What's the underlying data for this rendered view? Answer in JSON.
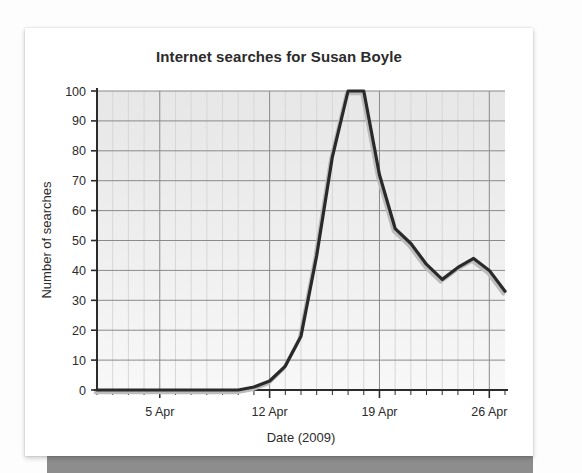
{
  "chart_data": {
    "type": "line",
    "title": "Internet searches for Susan Boyle",
    "xlabel": "Date (2009)",
    "ylabel": "Number of searches",
    "xlim": [
      1,
      27
    ],
    "ylim": [
      0,
      100
    ],
    "grid": true,
    "legend": "none",
    "y_ticks": [
      0,
      10,
      20,
      30,
      40,
      50,
      60,
      70,
      80,
      90,
      100
    ],
    "y_tick_labels": [
      "0",
      "10",
      "20",
      "30",
      "40",
      "50",
      "60",
      "70",
      "80",
      "90",
      "100"
    ],
    "x_ticks": [
      5,
      12,
      19,
      26
    ],
    "x_tick_labels": [
      "5 Apr",
      "12 Apr",
      "19 Apr",
      "26 Apr"
    ],
    "x_minor_step": 1,
    "series": [
      {
        "name": "Number of searches",
        "color": "#2a2a2a",
        "x": [
          1,
          2,
          3,
          4,
          5,
          6,
          7,
          8,
          9,
          10,
          11,
          12,
          13,
          14,
          15,
          16,
          17,
          18,
          19,
          20,
          21,
          22,
          23,
          24,
          25,
          26,
          27
        ],
        "values": [
          0,
          0,
          0,
          0,
          0,
          0,
          0,
          0,
          0,
          0,
          1,
          3,
          8,
          18,
          45,
          78,
          100,
          100,
          72,
          54,
          49,
          42,
          37,
          41,
          44,
          40,
          33
        ]
      }
    ],
    "annotations": []
  },
  "axis": {
    "y_title": "Number of searches",
    "x_title": "Date (2009)"
  },
  "style": {
    "plot_background": "#eeeeee",
    "line_color": "#2a2a2a",
    "shadow_color": "#b9b9b9",
    "major_grid_color": "#8a8a8a",
    "minor_grid_color": "#d7d7d7",
    "axis_color": "#2b2b2b",
    "card_background": "#ffffff",
    "band_color": "#8d8d8d"
  }
}
